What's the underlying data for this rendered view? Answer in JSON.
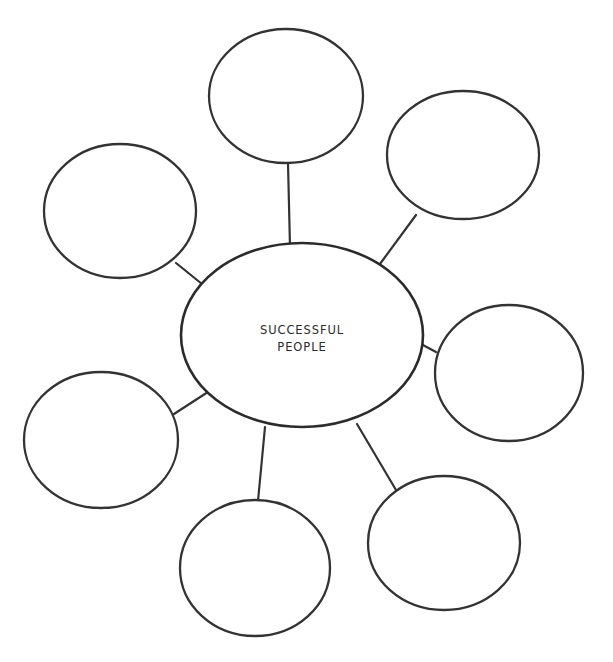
{
  "page": {
    "background_color": "#ffffff",
    "stroke_color": "#333333",
    "text_color": "#2b2b2b",
    "width": 613,
    "height": 662
  },
  "diagram": {
    "type": "web-organizer",
    "center": {
      "name": "center-oval",
      "label_line_1": "SUCCESSFUL",
      "label_line_2": "PEOPLE",
      "cx": 302,
      "cy": 335,
      "rx": 121,
      "ry": 92
    },
    "nodes": [
      {
        "id": "node-top",
        "label": "",
        "cx": 286,
        "cy": 96,
        "rx": 77,
        "ry": 67
      },
      {
        "id": "node-top-right",
        "label": "",
        "cx": 463,
        "cy": 155,
        "rx": 76,
        "ry": 64
      },
      {
        "id": "node-right",
        "label": "",
        "cx": 509,
        "cy": 373,
        "rx": 74,
        "ry": 68
      },
      {
        "id": "node-bottom-right",
        "label": "",
        "cx": 444,
        "cy": 543,
        "rx": 76,
        "ry": 67
      },
      {
        "id": "node-bottom",
        "label": "",
        "cx": 255,
        "cy": 568,
        "rx": 75,
        "ry": 68
      },
      {
        "id": "node-bottom-left",
        "label": "",
        "cx": 101,
        "cy": 440,
        "rx": 77,
        "ry": 68
      },
      {
        "id": "node-left",
        "label": "",
        "cx": 120,
        "cy": 211,
        "rx": 76,
        "ry": 67
      }
    ],
    "spokes": [
      {
        "id": "spoke-top",
        "x1": 288,
        "y1": 163,
        "x2": 290,
        "y2": 247
      },
      {
        "id": "spoke-top-right",
        "x1": 416,
        "y1": 215,
        "x2": 377,
        "y2": 268
      },
      {
        "id": "spoke-right",
        "x1": 436,
        "y1": 352,
        "x2": 421,
        "y2": 344
      },
      {
        "id": "spoke-bottom-right",
        "x1": 396,
        "y1": 490,
        "x2": 357,
        "y2": 424
      },
      {
        "id": "spoke-bottom",
        "x1": 258,
        "y1": 501,
        "x2": 265,
        "y2": 427
      },
      {
        "id": "spoke-bottom-left",
        "x1": 174,
        "y1": 414,
        "x2": 211,
        "y2": 390
      },
      {
        "id": "spoke-left",
        "x1": 176,
        "y1": 263,
        "x2": 202,
        "y2": 284
      }
    ]
  },
  "captions": {
    "top": "",
    "bottom": ""
  }
}
